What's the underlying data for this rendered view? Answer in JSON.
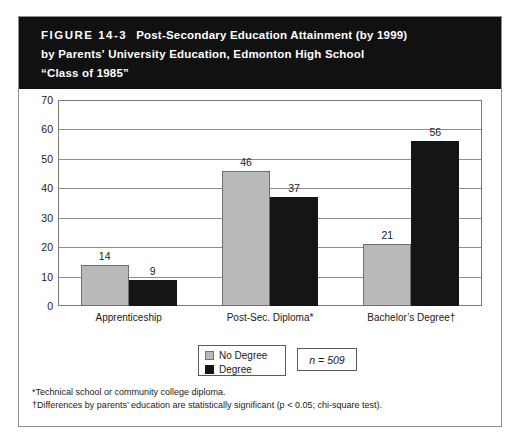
{
  "figure": {
    "number": "FIGURE 14-3",
    "title_lines": [
      "Post-Secondary Education Attainment (by 1999)",
      "by Parents' University Education, Edmonton High School",
      "“Class of 1985”"
    ]
  },
  "sample_note": "n = 509",
  "footnotes": [
    "*Technical school or community college diploma.",
    "†Differences by parents’ education are statistically significant (p < 0.05; chi-square test)."
  ],
  "colors": {
    "no_degree": "#b9b9b9",
    "degree": "#151515",
    "header_band": "#111111",
    "frame_border": "#8d8d8d",
    "gridline": "#8d8d8d"
  },
  "chart_data": {
    "type": "bar",
    "title": "Post-Secondary Education Attainment (by 1999) by Parents' University Education, Edmonton High School “Class of 1985”",
    "xlabel": "",
    "ylabel": "",
    "ylim": [
      0,
      70
    ],
    "yticks": [
      0,
      10,
      20,
      30,
      40,
      50,
      60,
      70
    ],
    "ytick_labels": [
      "0",
      "10",
      "20",
      "30",
      "40",
      "50",
      "60",
      "70"
    ],
    "grid": true,
    "legend_position": "below-center",
    "categories": [
      "Apprenticeship",
      "Post-Sec. Diploma*",
      "Bachelor’s Degree†"
    ],
    "series": [
      {
        "name": "No Degree",
        "color": "#b9b9b9",
        "values": [
          14,
          46,
          21
        ],
        "labels": [
          "14",
          "46",
          "21"
        ]
      },
      {
        "name": "Degree",
        "color": "#151515",
        "values": [
          9,
          37,
          56
        ],
        "labels": [
          "9",
          "37",
          "56"
        ]
      }
    ]
  }
}
